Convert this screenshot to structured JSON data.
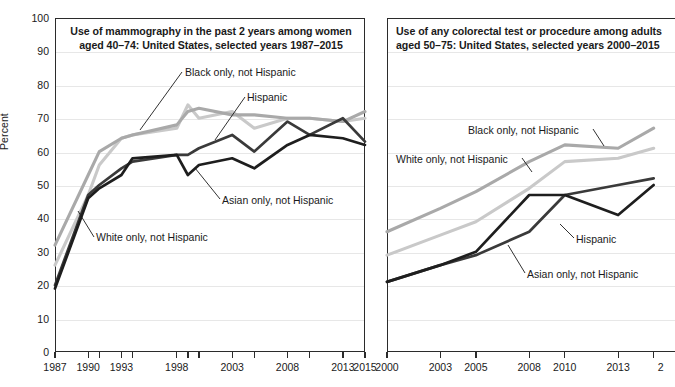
{
  "figure": {
    "ylabel": "Percent",
    "yticks": [
      0,
      10,
      20,
      30,
      40,
      50,
      60,
      70,
      80,
      90,
      100
    ],
    "series_colors": {
      "white_only_not_hispanic": "#a9a9a9",
      "black_only_not_hispanic": "#c9c9c9",
      "hispanic": "#3a3a3a",
      "asian_only_not_hispanic": "#1e1e1e"
    },
    "axis_color": "#2b2b2b",
    "grid_color": "#e7e7e7"
  },
  "panels": {
    "left": {
      "title_line1": "Use of mammography in the past 2 years among women",
      "title_line2": "aged 40–74: United States, selected years 1987–2015",
      "annotations": [
        {
          "name": "black-only-not-hispanic",
          "text": "Black only, not Hispanic"
        },
        {
          "name": "hispanic",
          "text": "Hispanic"
        },
        {
          "name": "asian-only-not-hispanic",
          "text": "Asian only, not Hispanic"
        },
        {
          "name": "white-only-not-hispanic",
          "text": "White only, not Hispanic"
        }
      ],
      "xticklabels": [
        "1987",
        "1990",
        "1993",
        "1998",
        "2003",
        "2008",
        "2013",
        "2015"
      ]
    },
    "right": {
      "title_line1": "Use of any colorectal test or procedure among adults",
      "title_line2": "aged 50–75: United States, selected years 2000–2015",
      "annotations": [
        {
          "name": "black-only-not-hispanic",
          "text": "Black only, not Hispanic"
        },
        {
          "name": "white-only-not-hispanic",
          "text": "White only, not Hispanic"
        },
        {
          "name": "hispanic",
          "text": "Hispanic"
        },
        {
          "name": "asian-only-not-hispanic",
          "text": "Asian only, not Hispanic"
        }
      ],
      "xticklabels": [
        "2000",
        "2003",
        "2005",
        "2008",
        "2010",
        "2013",
        "2"
      ]
    }
  },
  "chart_data": [
    {
      "type": "line",
      "title": "Use of mammography in the past 2 years among women aged 40–74: United States, selected years 1987–2015",
      "xlabel": "",
      "ylabel": "Percent",
      "ylim": [
        0,
        100
      ],
      "xlim": [
        1987,
        2015
      ],
      "grid": true,
      "legend": "inline-annotations",
      "x": [
        1987,
        1990,
        1991,
        1993,
        1994,
        1998,
        1999,
        2000,
        2003,
        2005,
        2008,
        2010,
        2013,
        2015
      ],
      "series": [
        {
          "name": "White only, not Hispanic",
          "color": "#a9a9a9",
          "values": [
            32,
            53,
            60,
            64,
            65,
            68,
            72,
            73,
            71,
            71,
            70,
            70,
            69,
            72
          ]
        },
        {
          "name": "Black only, not Hispanic",
          "color": "#c9c9c9",
          "values": [
            26,
            47,
            56,
            64,
            65,
            67,
            74,
            70,
            72,
            67,
            70,
            70,
            69,
            70
          ]
        },
        {
          "name": "Hispanic",
          "color": "#3a3a3a",
          "values": [
            20,
            47,
            50,
            55,
            57,
            59,
            59,
            61,
            65,
            60,
            69,
            65,
            70,
            63
          ]
        },
        {
          "name": "Asian only, not Hispanic",
          "color": "#1e1e1e",
          "values": [
            19,
            46,
            49,
            53,
            58,
            59,
            53,
            56,
            58,
            55,
            62,
            65,
            64,
            62
          ]
        }
      ]
    },
    {
      "type": "line",
      "title": "Use of any colorectal test or procedure among adults aged 50–75: United States, selected years 2000–2015",
      "xlabel": "",
      "ylabel": "Percent",
      "ylim": [
        0,
        100
      ],
      "xlim": [
        2000,
        2015
      ],
      "grid": true,
      "legend": "inline-annotations",
      "x": [
        2000,
        2003,
        2005,
        2008,
        2010,
        2013,
        2015
      ],
      "series": [
        {
          "name": "White only, not Hispanic",
          "color": "#a9a9a9",
          "values": [
            36,
            43,
            48,
            57,
            62,
            61,
            67
          ]
        },
        {
          "name": "Black only, not Hispanic",
          "color": "#c9c9c9",
          "values": [
            29,
            35,
            39,
            49,
            57,
            58,
            61
          ]
        },
        {
          "name": "Hispanic",
          "color": "#3a3a3a",
          "values": [
            21,
            26,
            29,
            36,
            47,
            50,
            52
          ]
        },
        {
          "name": "Asian only, not Hispanic",
          "color": "#1e1e1e",
          "values": [
            21,
            26,
            30,
            47,
            47,
            41,
            50
          ]
        }
      ]
    }
  ]
}
